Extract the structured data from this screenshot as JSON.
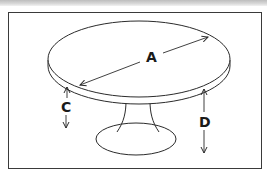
{
  "diagram": {
    "labels": {
      "a": "A",
      "c": "C",
      "d": "D"
    },
    "colors": {
      "line": "#2b2b2b",
      "frame": "#3a3a3a",
      "background": "#ffffff",
      "top_strip": "#c8c8c8"
    }
  }
}
